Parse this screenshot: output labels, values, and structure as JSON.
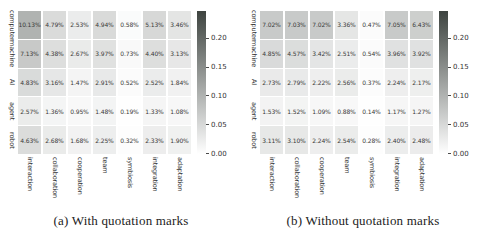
{
  "colors": {
    "background": "#ffffff",
    "heatmap_min": "#ffffff",
    "heatmap_max": "#3e4440",
    "cell_text": "#3a3a3a",
    "axis_label_text": "#333333",
    "caption_text": "#1c1c1c"
  },
  "chart_data": [
    {
      "type": "heatmap",
      "caption": "(a) With quotation marks",
      "rows": [
        "computer",
        "machine",
        "AI",
        "agent",
        "robot"
      ],
      "columns": [
        "interaction",
        "collaboration",
        "cooperation",
        "team",
        "symbiosis",
        "integration",
        "adaptation"
      ],
      "values_percent": [
        [
          10.13,
          4.79,
          2.53,
          4.94,
          0.58,
          5.13,
          3.46
        ],
        [
          7.13,
          4.38,
          2.67,
          3.97,
          0.73,
          4.4,
          3.13
        ],
        [
          4.83,
          3.16,
          1.47,
          2.91,
          0.52,
          2.52,
          1.84
        ],
        [
          2.57,
          1.36,
          0.95,
          1.48,
          0.19,
          1.33,
          1.08
        ],
        [
          4.63,
          2.68,
          1.68,
          2.25,
          0.32,
          2.33,
          1.9
        ]
      ],
      "colorbar": {
        "ticks": [
          0.2,
          0.15,
          0.1,
          0.05,
          0.0
        ],
        "vmax": 0.248
      }
    },
    {
      "type": "heatmap",
      "caption": "(b) Without quotation marks",
      "rows": [
        "computer",
        "machine",
        "AI",
        "agent",
        "robot"
      ],
      "columns": [
        "interaction",
        "collaboration",
        "cooperation",
        "team",
        "symbiosis",
        "integration",
        "adaptation"
      ],
      "values_percent": [
        [
          7.02,
          7.03,
          7.02,
          3.36,
          0.47,
          7.05,
          6.43
        ],
        [
          4.85,
          4.57,
          3.42,
          2.51,
          0.54,
          3.96,
          3.92
        ],
        [
          2.73,
          2.79,
          2.22,
          2.56,
          0.37,
          2.24,
          2.17
        ],
        [
          1.53,
          1.52,
          1.09,
          0.88,
          0.14,
          1.17,
          1.27
        ],
        [
          3.11,
          3.1,
          2.24,
          2.54,
          0.28,
          2.4,
          2.48
        ]
      ],
      "colorbar": {
        "ticks": [
          0.2,
          0.15,
          0.1,
          0.05,
          0.0
        ],
        "vmax": 0.248
      }
    }
  ]
}
